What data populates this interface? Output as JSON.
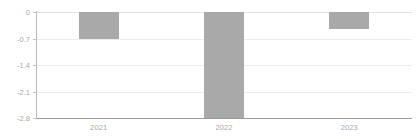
{
  "chart_data": {
    "type": "bar",
    "title": "",
    "subtitle": "",
    "xlabel": "",
    "ylabel": "",
    "categories": [
      "2021",
      "2022",
      "2023"
    ],
    "values": [
      -0.7,
      -2.8,
      -0.46
    ],
    "series": [
      {
        "name": "",
        "values": [
          -0.7,
          -2.8,
          -0.46
        ],
        "color": "#a9a9a9"
      }
    ],
    "ylim": [
      -2.8,
      0
    ],
    "yticks": [
      0,
      -0.7,
      -1.4,
      -2.1,
      -2.8
    ],
    "ytick_labels": [
      "0",
      "-0.7",
      "-1.4",
      "-2.1",
      "-2.8"
    ],
    "grid": true,
    "grid_axis": "y",
    "legend": false,
    "legend_position": "none",
    "bar_color": "#a9a9a9",
    "gridline_color": "#ededed",
    "axis_color": "#9a9a9a",
    "tick_label_color": "#a8a8a8",
    "background": "#ffffff"
  }
}
